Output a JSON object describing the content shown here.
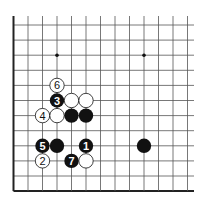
{
  "diagram": {
    "type": "go-board-fragment",
    "columns": 13,
    "rows": 12,
    "edges": [
      "left",
      "bottom"
    ],
    "colors": {
      "line": "#555555",
      "edge": "#222222",
      "black": "#111111",
      "white": "#ffffff",
      "background": "#ffffff"
    },
    "star_points": [
      {
        "col": 3,
        "row": 2
      },
      {
        "col": 9,
        "row": 2
      }
    ],
    "stones": [
      {
        "col": 3,
        "row": 4,
        "color": "white",
        "label": "6"
      },
      {
        "col": 3,
        "row": 5,
        "color": "black",
        "label": "3"
      },
      {
        "col": 4,
        "row": 5,
        "color": "white",
        "label": ""
      },
      {
        "col": 5,
        "row": 5,
        "color": "white",
        "label": ""
      },
      {
        "col": 2,
        "row": 6,
        "color": "white",
        "label": "4"
      },
      {
        "col": 3,
        "row": 6,
        "color": "white",
        "label": ""
      },
      {
        "col": 4,
        "row": 6,
        "color": "black",
        "label": ""
      },
      {
        "col": 5,
        "row": 6,
        "color": "black",
        "label": ""
      },
      {
        "col": 2,
        "row": 8,
        "color": "black",
        "label": "5"
      },
      {
        "col": 3,
        "row": 8,
        "color": "black",
        "label": ""
      },
      {
        "col": 5,
        "row": 8,
        "color": "black",
        "label": "1"
      },
      {
        "col": 9,
        "row": 8,
        "color": "black",
        "label": ""
      },
      {
        "col": 2,
        "row": 9,
        "color": "white",
        "label": "2"
      },
      {
        "col": 4,
        "row": 9,
        "color": "black",
        "label": "7"
      },
      {
        "col": 5,
        "row": 9,
        "color": "white",
        "label": ""
      }
    ]
  }
}
